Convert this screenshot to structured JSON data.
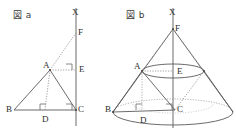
{
  "page": {
    "background": "#ffffff",
    "ink": "#4a4a4a",
    "label_color": "#2e2e2e",
    "width": 236,
    "height": 133
  },
  "figures": [
    {
      "id": "figure-a",
      "caption": "図 a",
      "type": "2d-triangle-with-axis",
      "axis_label_top": "X",
      "points": [
        {
          "name": "X",
          "label": "X",
          "x": 76,
          "y": 13,
          "role": "axis-top"
        },
        {
          "name": "F",
          "label": "F",
          "x": 76,
          "y": 33,
          "role": "axis-point"
        },
        {
          "name": "A",
          "label": "A",
          "x": 50,
          "y": 70,
          "role": "apex"
        },
        {
          "name": "E",
          "label": "E",
          "x": 76,
          "y": 70,
          "role": "axis-foot"
        },
        {
          "name": "B",
          "label": "B",
          "x": 14,
          "y": 110,
          "role": "base-left"
        },
        {
          "name": "D",
          "label": "D",
          "x": 45,
          "y": 110,
          "role": "base-foot"
        },
        {
          "name": "C",
          "label": "C",
          "x": 76,
          "y": 110,
          "role": "base-right"
        }
      ],
      "solid_segments": [
        [
          "B",
          "A"
        ],
        [
          "A",
          "C"
        ],
        [
          "B",
          "C"
        ]
      ],
      "dotted_segments": [
        [
          "A",
          "D"
        ],
        [
          "A",
          "E"
        ],
        [
          "A",
          "F"
        ]
      ],
      "axis_line": {
        "from": [
          76,
          8
        ],
        "to": [
          76,
          126
        ]
      },
      "right_angles": [
        "D",
        "E",
        "C"
      ]
    },
    {
      "id": "figure-b",
      "caption": "図 b",
      "type": "3d-cone-of-revolution",
      "axis_label_top": "X",
      "points": [
        {
          "name": "X",
          "label": "X",
          "x": 173,
          "y": 13,
          "role": "axis-top"
        },
        {
          "name": "F",
          "label": "F",
          "x": 173,
          "y": 29,
          "role": "apex"
        },
        {
          "name": "A",
          "label": "A",
          "x": 142,
          "y": 70,
          "role": "upper-circle-left"
        },
        {
          "name": "E",
          "label": "E",
          "x": 176,
          "y": 72,
          "role": "upper-circle-center"
        },
        {
          "name": "B",
          "label": "B",
          "x": 113,
          "y": 110,
          "role": "base-circle-left"
        },
        {
          "name": "D",
          "label": "D",
          "x": 143,
          "y": 114,
          "role": "base-foot"
        },
        {
          "name": "C",
          "label": "C",
          "x": 175,
          "y": 110,
          "role": "base-circle-center"
        }
      ],
      "base_ellipse": {
        "cx": 173,
        "cy": 112,
        "rx": 60,
        "ry": 13
      },
      "upper_ellipse": {
        "cx": 173,
        "cy": 71,
        "rx": 31,
        "ry": 7
      },
      "axis_line": {
        "from": [
          173,
          8
        ],
        "to": [
          173,
          128
        ]
      },
      "right_angles": [
        "D",
        "C"
      ]
    }
  ]
}
